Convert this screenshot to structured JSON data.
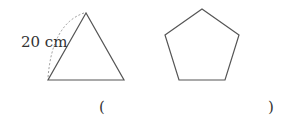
{
  "figures": {
    "triangle": {
      "side_label": "20 cm",
      "points": "86,13 48,80 124,80"
    },
    "pentagon": {
      "points": "202,9 239,35 225,80 179,80 165,35"
    }
  },
  "answer": {
    "open_paren": "(",
    "close_paren": ")"
  },
  "colors": {
    "stroke": "#555555",
    "dashed": "#999999"
  }
}
